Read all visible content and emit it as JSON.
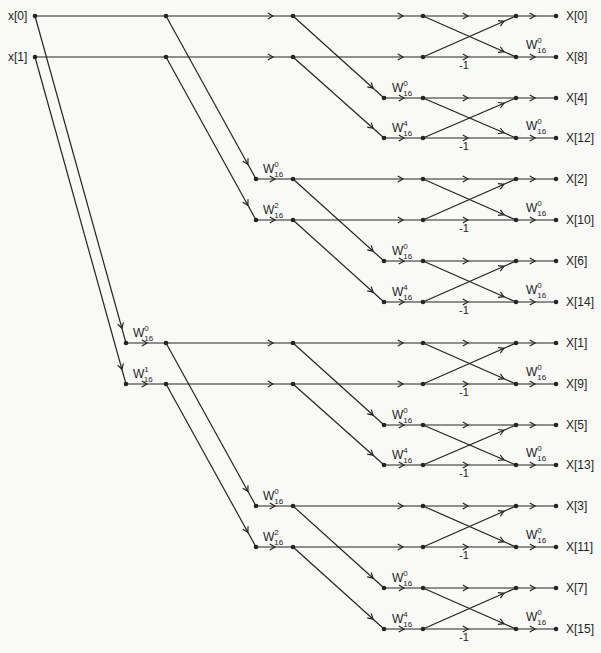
{
  "figure": {
    "type": "fft-butterfly-flow-graph",
    "width": 601,
    "height": 653,
    "ink_color": "#242424",
    "background_color": "#f9f9f7"
  },
  "labels": {
    "inputs": [
      "x[0]",
      "x[1]"
    ],
    "outputs": [
      "X[0]",
      "X[8]",
      "X[4]",
      "X[12]",
      "X[2]",
      "X[10]",
      "X[6]",
      "X[14]",
      "X[1]",
      "X[9]",
      "X[5]",
      "X[13]",
      "X[3]",
      "X[11]",
      "X[7]",
      "X[15]"
    ],
    "negation": "-1",
    "twiddle_base": "W",
    "twiddle_subscript": "16"
  },
  "layout": {
    "row_ys": [
      16,
      57,
      98,
      138,
      179,
      220,
      261,
      302,
      343,
      384,
      425,
      465,
      506,
      547,
      588,
      629
    ],
    "cols": {
      "input": 35,
      "t1": 126,
      "c1": 166,
      "t2": 256,
      "c2": 293,
      "t3": 384,
      "c3": 423,
      "c4": 516,
      "end": 556
    },
    "line_width": 1.2,
    "dot_radius": 2.3,
    "arrow_size": 6,
    "h_arrows": {
      "t1-c1": 147,
      "c1-c2": 273,
      "t2-c2": 275,
      "c2-c3": 403,
      "t3-c3": 404,
      "c3-c4": 468,
      "c4-end": 535
    },
    "branch_arrow_t": {
      "input": 0.955,
      "c1": 0.91,
      "c2": 0.88
    },
    "cross_arrow_t": 0.87,
    "input_label_x": 8,
    "output_label_x": 566,
    "label_baseline_dy": 4,
    "negation_x": 464,
    "negation_dy": 12,
    "twiddle_x": {
      "t1": 133,
      "t2": 263,
      "t3": 392,
      "out": 526
    },
    "twiddle_dy_stage": -6,
    "twiddle_dy_out": -8,
    "font_size_label": 12,
    "font_size_negation": 11,
    "font_size_twiddle": 12,
    "font_size_twiddle_script": 8
  },
  "structure": {
    "row_start": [
      "input",
      "input",
      "t3",
      "t3",
      "t2",
      "t2",
      "t3",
      "t3",
      "t1",
      "t1",
      "t3",
      "t3",
      "t2",
      "t2",
      "t3",
      "t3"
    ],
    "column_sequences": {
      "input": [
        "input",
        "c1",
        "c2",
        "c3",
        "c4",
        "end"
      ],
      "t1": [
        "t1",
        "c1",
        "c2",
        "c3",
        "c4",
        "end"
      ],
      "t2": [
        "t2",
        "c2",
        "c3",
        "c4",
        "end"
      ],
      "t3": [
        "t3",
        "c3",
        "c4",
        "end"
      ]
    },
    "branches": [
      {
        "from": [
          "input",
          0
        ],
        "to": [
          "t1",
          8
        ]
      },
      {
        "from": [
          "input",
          1
        ],
        "to": [
          "t1",
          9
        ]
      },
      {
        "from": [
          "c1",
          0
        ],
        "to": [
          "t2",
          4
        ]
      },
      {
        "from": [
          "c1",
          1
        ],
        "to": [
          "t2",
          5
        ]
      },
      {
        "from": [
          "c1",
          8
        ],
        "to": [
          "t2",
          12
        ]
      },
      {
        "from": [
          "c1",
          9
        ],
        "to": [
          "t2",
          13
        ]
      },
      {
        "from": [
          "c2",
          0
        ],
        "to": [
          "t3",
          2
        ]
      },
      {
        "from": [
          "c2",
          1
        ],
        "to": [
          "t3",
          3
        ]
      },
      {
        "from": [
          "c2",
          4
        ],
        "to": [
          "t3",
          6
        ]
      },
      {
        "from": [
          "c2",
          5
        ],
        "to": [
          "t3",
          7
        ]
      },
      {
        "from": [
          "c2",
          8
        ],
        "to": [
          "t3",
          10
        ]
      },
      {
        "from": [
          "c2",
          9
        ],
        "to": [
          "t3",
          11
        ]
      },
      {
        "from": [
          "c2",
          12
        ],
        "to": [
          "t3",
          14
        ]
      },
      {
        "from": [
          "c2",
          13
        ],
        "to": [
          "t3",
          15
        ]
      }
    ],
    "butterfly_pairs": [
      [
        0,
        1
      ],
      [
        2,
        3
      ],
      [
        4,
        5
      ],
      [
        6,
        7
      ],
      [
        8,
        9
      ],
      [
        10,
        11
      ],
      [
        12,
        13
      ],
      [
        14,
        15
      ]
    ],
    "negation_rows": [
      1,
      3,
      5,
      7,
      9,
      11,
      13,
      15
    ]
  },
  "twiddles": [
    {
      "row": 8,
      "col": "t1",
      "exp": "0"
    },
    {
      "row": 9,
      "col": "t1",
      "exp": "1"
    },
    {
      "row": 4,
      "col": "t2",
      "exp": "0"
    },
    {
      "row": 5,
      "col": "t2",
      "exp": "2"
    },
    {
      "row": 12,
      "col": "t2",
      "exp": "0"
    },
    {
      "row": 13,
      "col": "t2",
      "exp": "2"
    },
    {
      "row": 2,
      "col": "t3",
      "exp": "0"
    },
    {
      "row": 3,
      "col": "t3",
      "exp": "4"
    },
    {
      "row": 6,
      "col": "t3",
      "exp": "0"
    },
    {
      "row": 7,
      "col": "t3",
      "exp": "4"
    },
    {
      "row": 10,
      "col": "t3",
      "exp": "0"
    },
    {
      "row": 11,
      "col": "t3",
      "exp": "4"
    },
    {
      "row": 14,
      "col": "t3",
      "exp": "0"
    },
    {
      "row": 15,
      "col": "t3",
      "exp": "4"
    },
    {
      "row": 1,
      "col": "out",
      "exp": "0"
    },
    {
      "row": 3,
      "col": "out",
      "exp": "0"
    },
    {
      "row": 5,
      "col": "out",
      "exp": "0"
    },
    {
      "row": 7,
      "col": "out",
      "exp": "0"
    },
    {
      "row": 9,
      "col": "out",
      "exp": "0"
    },
    {
      "row": 11,
      "col": "out",
      "exp": "0"
    },
    {
      "row": 13,
      "col": "out",
      "exp": "0"
    },
    {
      "row": 15,
      "col": "out",
      "exp": "0"
    }
  ]
}
